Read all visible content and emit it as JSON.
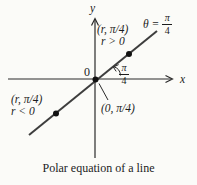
{
  "figure": {
    "caption": "Polar equation of a line",
    "colors": {
      "background": "#fbfbf8",
      "ink": "#1c1c1c",
      "line": "#3d3d3d"
    },
    "axes": {
      "x_label": "x",
      "y_label": "y",
      "origin_label": "0"
    },
    "line_equation": {
      "lhs": "θ =",
      "numerator": "π",
      "denominator": "4"
    },
    "angle_label": {
      "numerator": "π",
      "denominator": "4"
    },
    "points": {
      "positive": {
        "coordinates": "(r, π/4)",
        "condition": "r > 0"
      },
      "negative": {
        "coordinates": "(r, π/4)",
        "condition": "r < 0"
      },
      "pole": {
        "coordinates": "(0, π/4)"
      }
    }
  }
}
